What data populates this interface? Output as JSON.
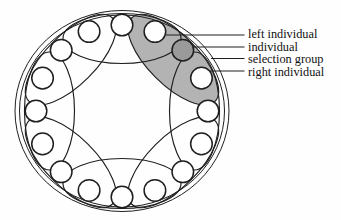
{
  "figure": {
    "kind": "ring population topology with overlapping neighborhood selection groups",
    "individual_count": 16,
    "group_count": 8,
    "selected_group": {
      "center_individual_index": 2,
      "left_individual_index": 1,
      "right_individual_index": 3,
      "covered_individuals": [
        1,
        2,
        3
      ]
    },
    "colors": {
      "background": "#fefefe",
      "stroke": "#1f1f1f",
      "selection_group_fill": "#b3b3b3",
      "selected_individual_fill": "#9a9a9a",
      "individual_fill": "#ffffff",
      "label_text": "#111111"
    },
    "geometry": {
      "center_x": 122,
      "center_y": 111,
      "outer_boundary_rx": 107,
      "outer_boundary_ry": 100.5,
      "inner_boundary_rx": 102.5,
      "inner_boundary_ry": 96,
      "ring_radius": 86,
      "individual_radius": 10.8,
      "group_center_radius": 72.5,
      "group_semi_major": 59,
      "group_semi_minor": 25
    }
  },
  "labels": [
    {
      "text": "left individual",
      "leader": {
        "x1": 166,
        "y1": 35,
        "x2": 244.5,
        "y2": 35
      },
      "tx": 248,
      "ty": 38
    },
    {
      "text": "individual",
      "leader": {
        "x1": 193,
        "y1": 47,
        "x2": 244.5,
        "y2": 47
      },
      "tx": 248,
      "ty": 50.5
    },
    {
      "text": "selection group",
      "leader": {
        "x1": 211,
        "y1": 58.5,
        "x2": 244.5,
        "y2": 58.5
      },
      "tx": 248,
      "ty": 63
    },
    {
      "text": "right individual",
      "leader": {
        "x1": 210,
        "y1": 71,
        "x2": 244.5,
        "y2": 71
      },
      "tx": 248,
      "ty": 75.5
    }
  ]
}
